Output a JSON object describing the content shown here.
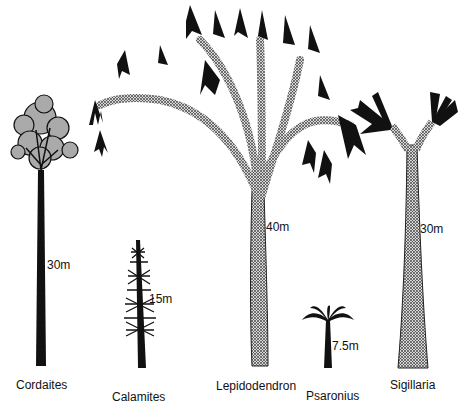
{
  "trees": [
    {
      "name": "Cordaites",
      "height": "30m"
    },
    {
      "name": "Calamites",
      "height": "15m"
    },
    {
      "name": "Lepidodendron",
      "height": "40m"
    },
    {
      "name": "Psaronius",
      "height": "7.5m"
    },
    {
      "name": "Sigillaria",
      "height": "30m"
    }
  ],
  "colors": {
    "ink": "#111111",
    "background": "#ffffff"
  }
}
